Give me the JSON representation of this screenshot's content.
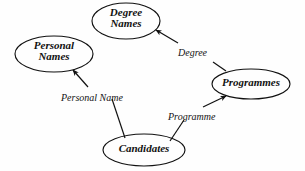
{
  "diagram": {
    "background_color": "#fefefe",
    "stroke_color": "#111111",
    "text_color": "#111111",
    "nodes": [
      {
        "id": "degree-names",
        "label_line1": "Degree",
        "label_line2": "Names",
        "shape": "ellipse",
        "cx": 126,
        "cy": 21,
        "rx": 34,
        "ry": 18
      },
      {
        "id": "personal-names",
        "label_line1": "Personal",
        "label_line2": "Names",
        "shape": "ellipse",
        "cx": 54,
        "cy": 54,
        "rx": 39,
        "ry": 18
      },
      {
        "id": "programmes",
        "label_line1": "Programmes",
        "label_line2": "",
        "shape": "ellipse",
        "cx": 251,
        "cy": 84,
        "rx": 39,
        "ry": 15
      },
      {
        "id": "candidates",
        "label_line1": "Candidates",
        "label_line2": "",
        "shape": "ellipse",
        "cx": 144,
        "cy": 150,
        "rx": 41,
        "ry": 16
      }
    ],
    "edges": [
      {
        "id": "programmes-to-degree-names",
        "label": "Degree",
        "from": "programmes",
        "to": "degree-names",
        "label_x": 178,
        "label_y": 47
      },
      {
        "id": "candidates-to-personal-names",
        "label": "Personal Name",
        "from": "candidates",
        "to": "personal-names",
        "label_x": 61,
        "label_y": 92
      },
      {
        "id": "candidates-to-programmes",
        "label": "Programme",
        "from": "candidates",
        "to": "programmes",
        "label_x": 168,
        "label_y": 111
      }
    ]
  }
}
